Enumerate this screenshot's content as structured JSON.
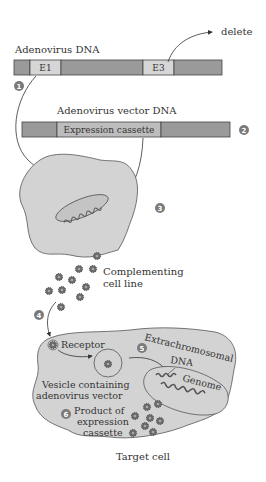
{
  "colors": {
    "dark_segment": "#9a9a9a",
    "light_segment": "#d6d6d6",
    "cell_fill": "#d3d3d3",
    "outline": "#555555",
    "virus": "#6a6a6a",
    "step_circle": "#7a7a7a",
    "text": "#333333"
  },
  "adenovirus_dna": {
    "label": "Adenovirus DNA",
    "segments": [
      "",
      "E1",
      "",
      "E3",
      ""
    ],
    "delete_label": "delete"
  },
  "vector_dna": {
    "label": "Adenovirus vector DNA",
    "segments": [
      "",
      "Expression cassette",
      ""
    ]
  },
  "steps": [
    "1",
    "2",
    "3",
    "4",
    "5",
    "6"
  ],
  "complementing": {
    "line1": "Complementing",
    "line2": "cell line"
  },
  "target_cell": {
    "receptor_label": "Receptor",
    "extrachromosomal_line1": "Extrachromosomal",
    "extrachromosomal_line2": "DNA",
    "genome_label": "Genome",
    "vesicle_line1": "Vesicle containing",
    "vesicle_line2": "adenovirus vector",
    "product_line1": "Product of",
    "product_line2": "expression",
    "product_line3": "cassette",
    "caption": "Target cell"
  }
}
